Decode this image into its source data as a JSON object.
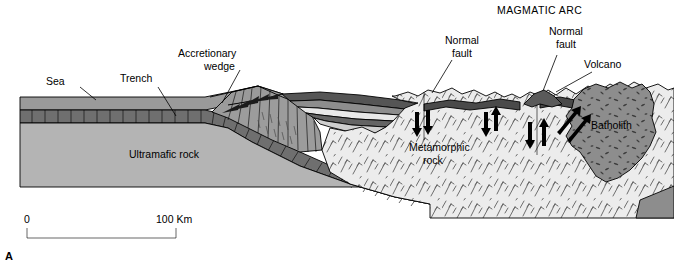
{
  "figure": {
    "panel_label": "A",
    "title_caption": "MAGMATIC ARC"
  },
  "labels": {
    "sea": "Sea",
    "trench": "Trench",
    "accretionary_wedge": "Accretionary\nwedge",
    "accretionary_wedge_line1": "Accretionary",
    "accretionary_wedge_line2": "wedge",
    "ultramafic_rock": "Ultramafic rock",
    "metamorphic_rock_line1": "Metamorphic",
    "metamorphic_rock_line2": "rock",
    "normal_fault_1_line1": "Normal",
    "normal_fault_1_line2": "fault",
    "normal_fault_2_line1": "Normal",
    "normal_fault_2_line2": "fault",
    "volcano": "Volcano",
    "batholith": "Batholith",
    "magmatic_arc": "MAGMATIC ARC"
  },
  "scale_bar": {
    "start_label": "0",
    "end_label": "100 Km",
    "length_km": 100
  },
  "colors": {
    "background": "#ffffff",
    "sea_water": "#9a9a9a",
    "oceanic_crust": "#6f6f6f",
    "ultramafic_rock": "#b4b4b4",
    "accretionary_wedge": "#9c9c9c",
    "forearc_sediment_light": "#e8e8e8",
    "forearc_sediment_dark": "#646464",
    "metamorphic_rock": "#ececec",
    "batholith": "#8d8d8d",
    "volcano": "#5a5a5a",
    "outline": "#000000"
  },
  "elements": {
    "fault_arrow_count": 4,
    "subduction_slab": "oceanic crust descending to the right",
    "volcano_shape": "small dark cone above batholith"
  }
}
